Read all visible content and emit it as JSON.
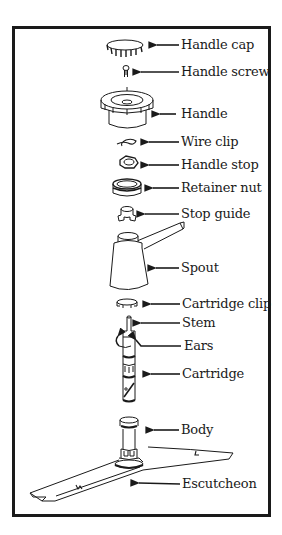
{
  "diagram": {
    "type": "exploded-parts-view",
    "line_color": "#1a1a1a",
    "background": "#ffffff",
    "parts": [
      {
        "id": "handle-cap",
        "label": "Handle cap",
        "y": 45
      },
      {
        "id": "handle-screw",
        "label": "Handle screw",
        "y": 72
      },
      {
        "id": "handle",
        "label": "Handle",
        "y": 114
      },
      {
        "id": "wire-clip",
        "label": "Wire clip",
        "y": 142
      },
      {
        "id": "handle-stop",
        "label": "Handle stop",
        "y": 165
      },
      {
        "id": "retainer-nut",
        "label": "Retainer nut",
        "y": 188
      },
      {
        "id": "stop-guide",
        "label": "Stop guide",
        "y": 214
      },
      {
        "id": "spout",
        "label": "Spout",
        "y": 268
      },
      {
        "id": "cartridge-clip",
        "label": "Cartridge clip",
        "y": 303
      },
      {
        "id": "stem",
        "label": "Stem",
        "y": 323
      },
      {
        "id": "ears",
        "label": "Ears",
        "y": 346
      },
      {
        "id": "cartridge",
        "label": "Cartridge",
        "y": 374
      },
      {
        "id": "body",
        "label": "Body",
        "y": 430
      },
      {
        "id": "escutcheon",
        "label": "Escutcheon",
        "y": 484
      }
    ]
  }
}
